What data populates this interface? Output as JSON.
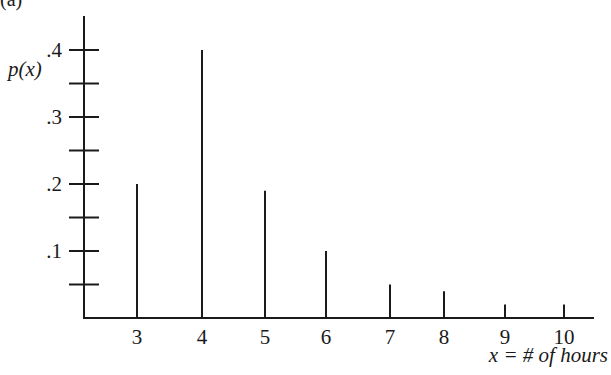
{
  "panel_label": "(a)",
  "chart_data": {
    "type": "bar",
    "style": "spike / vertical line plot (probability distribution)",
    "title": "",
    "xlabel": "x = # of hours",
    "ylabel": "p(x)",
    "categories": [
      "3",
      "4",
      "5",
      "6",
      "7",
      "8",
      "9",
      "10"
    ],
    "x": [
      3,
      4,
      5,
      6,
      7,
      8,
      9,
      10
    ],
    "values": [
      0.2,
      0.4,
      0.19,
      0.1,
      0.05,
      0.04,
      0.02,
      0.02
    ],
    "ylim": [
      0,
      0.45
    ],
    "y_ticks": [
      0.05,
      0.1,
      0.15,
      0.2,
      0.25,
      0.3,
      0.35,
      0.4
    ],
    "y_tick_labels": [
      {
        "value": 0.1,
        "label": ".1"
      },
      {
        "value": 0.2,
        "label": ".2"
      },
      {
        "value": 0.3,
        "label": ".3"
      },
      {
        "value": 0.4,
        "label": ".4"
      }
    ],
    "x_tick_labels": [
      "3",
      "4",
      "5",
      "6",
      "7",
      "8",
      "9",
      "10"
    ],
    "grid": false,
    "legend": null
  }
}
